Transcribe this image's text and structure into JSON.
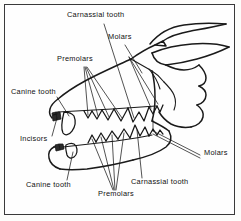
{
  "figure": {
    "background_color": "#fefefe",
    "border_color": "#3a3a3a",
    "line_color": "#1a1a1a",
    "text_color": "#111111"
  },
  "labels": [
    {
      "id": "carnassial-upper",
      "text": "Carnassial tooth",
      "x": 67,
      "y": 15,
      "anchor": "upper-jaw"
    },
    {
      "id": "molars-upper",
      "text": "Molars",
      "x": 108,
      "y": 37,
      "anchor": "upper-jaw"
    },
    {
      "id": "premolars-upper",
      "text": "Premolars",
      "x": 57,
      "y": 59,
      "anchor": "upper-jaw"
    },
    {
      "id": "canine-upper",
      "text": "Canine tooth",
      "x": 11,
      "y": 92,
      "anchor": "upper-jaw"
    },
    {
      "id": "incisors",
      "text": "Incisors",
      "x": 20,
      "y": 139,
      "anchor": "front-jaw"
    },
    {
      "id": "canine-lower",
      "text": "Canine tooth",
      "x": 26,
      "y": 185,
      "anchor": "lower-jaw"
    },
    {
      "id": "premolars-lower",
      "text": "Premolars",
      "x": 98,
      "y": 194,
      "anchor": "lower-jaw"
    },
    {
      "id": "carnassial-lower",
      "text": "Carnassial tooth",
      "x": 131,
      "y": 182,
      "anchor": "lower-jaw"
    },
    {
      "id": "molars-lower",
      "text": "Molars",
      "x": 204,
      "y": 153,
      "anchor": "lower-jaw"
    }
  ],
  "tooth_groups": [
    {
      "name": "Incisors",
      "jaw": "both",
      "count": 6
    },
    {
      "name": "Canine tooth",
      "jaw": "upper",
      "count": 1
    },
    {
      "name": "Canine tooth",
      "jaw": "lower",
      "count": 1
    },
    {
      "name": "Premolars",
      "jaw": "upper",
      "count": 4
    },
    {
      "name": "Premolars",
      "jaw": "lower",
      "count": 4
    },
    {
      "name": "Carnassial tooth",
      "jaw": "upper",
      "count": 1
    },
    {
      "name": "Carnassial tooth",
      "jaw": "lower",
      "count": 1
    },
    {
      "name": "Molars",
      "jaw": "upper",
      "count": 2
    },
    {
      "name": "Molars",
      "jaw": "lower",
      "count": 2
    }
  ]
}
